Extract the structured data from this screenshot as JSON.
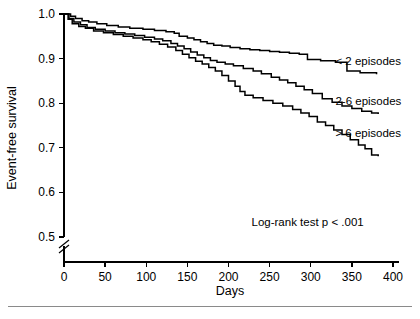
{
  "chart_data": {
    "type": "line",
    "subtype": "kaplan-meier-step",
    "title": "",
    "xlabel": "Days",
    "ylabel": "Event-free survival",
    "xlim": [
      0,
      400
    ],
    "ylim": [
      0.5,
      1.0
    ],
    "xticks": [
      0,
      50,
      100,
      150,
      200,
      250,
      300,
      350,
      400
    ],
    "xtick_labels": [
      "0",
      "50",
      "100",
      "150",
      "200",
      "250",
      "300",
      "350",
      "400"
    ],
    "yticks": [
      0.5,
      0.6,
      0.7,
      0.8,
      0.9,
      1.0
    ],
    "ytick_labels": [
      "0.5",
      "0.6",
      "0.7",
      "0.8",
      "0.9",
      "1.0"
    ],
    "y_axis_break": true,
    "y_axis_break_note": "axis broken below 0.5",
    "grid": false,
    "legend_position": "inline-right-of-curves",
    "annotations": [
      {
        "name": "log-rank-annotation",
        "text": "Log-rank test p < .001",
        "x": 228,
        "y": 0.525
      }
    ],
    "series": [
      {
        "name": "< 2 episodes",
        "label": "< 2 episodes",
        "color": "#000000",
        "label_x": 330,
        "label_y": 0.885,
        "points": [
          [
            0,
            1.0
          ],
          [
            8,
            0.995
          ],
          [
            14,
            0.99
          ],
          [
            22,
            0.985
          ],
          [
            30,
            0.982
          ],
          [
            40,
            0.978
          ],
          [
            52,
            0.974
          ],
          [
            66,
            0.971
          ],
          [
            80,
            0.968
          ],
          [
            96,
            0.966
          ],
          [
            110,
            0.963
          ],
          [
            124,
            0.96
          ],
          [
            134,
            0.957
          ],
          [
            140,
            0.95
          ],
          [
            150,
            0.946
          ],
          [
            158,
            0.942
          ],
          [
            166,
            0.938
          ],
          [
            174,
            0.934
          ],
          [
            182,
            0.93
          ],
          [
            192,
            0.928
          ],
          [
            202,
            0.925
          ],
          [
            214,
            0.922
          ],
          [
            226,
            0.92
          ],
          [
            238,
            0.918
          ],
          [
            250,
            0.916
          ],
          [
            262,
            0.914
          ],
          [
            274,
            0.912
          ],
          [
            286,
            0.91
          ],
          [
            296,
            0.898
          ],
          [
            312,
            0.895
          ],
          [
            330,
            0.892
          ],
          [
            344,
            0.872
          ],
          [
            360,
            0.868
          ],
          [
            380,
            0.865
          ]
        ]
      },
      {
        "name": "2-6 episodes",
        "label": "2-6 episodes",
        "color": "#000000",
        "label_x": 330,
        "label_y": 0.795,
        "points": [
          [
            0,
            1.0
          ],
          [
            6,
            0.99
          ],
          [
            12,
            0.982
          ],
          [
            20,
            0.976
          ],
          [
            28,
            0.97
          ],
          [
            38,
            0.966
          ],
          [
            50,
            0.962
          ],
          [
            62,
            0.958
          ],
          [
            74,
            0.955
          ],
          [
            86,
            0.952
          ],
          [
            98,
            0.948
          ],
          [
            110,
            0.944
          ],
          [
            120,
            0.94
          ],
          [
            130,
            0.934
          ],
          [
            138,
            0.928
          ],
          [
            146,
            0.922
          ],
          [
            154,
            0.915
          ],
          [
            162,
            0.908
          ],
          [
            170,
            0.902
          ],
          [
            178,
            0.896
          ],
          [
            186,
            0.892
          ],
          [
            196,
            0.888
          ],
          [
            206,
            0.884
          ],
          [
            218,
            0.878
          ],
          [
            230,
            0.872
          ],
          [
            240,
            0.866
          ],
          [
            252,
            0.858
          ],
          [
            262,
            0.852
          ],
          [
            272,
            0.846
          ],
          [
            282,
            0.838
          ],
          [
            292,
            0.83
          ],
          [
            302,
            0.822
          ],
          [
            314,
            0.81
          ],
          [
            326,
            0.802
          ],
          [
            338,
            0.794
          ],
          [
            350,
            0.788
          ],
          [
            362,
            0.782
          ],
          [
            374,
            0.778
          ],
          [
            382,
            0.776
          ]
        ]
      },
      {
        "name": "> 6 episodes",
        "label": "> 6 episodes",
        "color": "#000000",
        "label_x": 330,
        "label_y": 0.725,
        "points": [
          [
            0,
            1.0
          ],
          [
            5,
            0.988
          ],
          [
            10,
            0.978
          ],
          [
            18,
            0.972
          ],
          [
            26,
            0.968
          ],
          [
            36,
            0.962
          ],
          [
            48,
            0.958
          ],
          [
            60,
            0.954
          ],
          [
            72,
            0.95
          ],
          [
            84,
            0.946
          ],
          [
            96,
            0.942
          ],
          [
            106,
            0.938
          ],
          [
            116,
            0.932
          ],
          [
            126,
            0.926
          ],
          [
            136,
            0.918
          ],
          [
            144,
            0.91
          ],
          [
            152,
            0.902
          ],
          [
            160,
            0.894
          ],
          [
            168,
            0.888
          ],
          [
            176,
            0.88
          ],
          [
            184,
            0.872
          ],
          [
            192,
            0.862
          ],
          [
            200,
            0.85
          ],
          [
            208,
            0.838
          ],
          [
            214,
            0.826
          ],
          [
            220,
            0.818
          ],
          [
            230,
            0.812
          ],
          [
            242,
            0.806
          ],
          [
            254,
            0.8
          ],
          [
            266,
            0.794
          ],
          [
            278,
            0.786
          ],
          [
            288,
            0.778
          ],
          [
            298,
            0.77
          ],
          [
            308,
            0.758
          ],
          [
            318,
            0.75
          ],
          [
            328,
            0.74
          ],
          [
            338,
            0.73
          ],
          [
            348,
            0.718
          ],
          [
            358,
            0.706
          ],
          [
            366,
            0.698
          ],
          [
            374,
            0.684
          ],
          [
            382,
            0.681
          ]
        ]
      }
    ]
  },
  "figure": {
    "footer_rule": true
  }
}
